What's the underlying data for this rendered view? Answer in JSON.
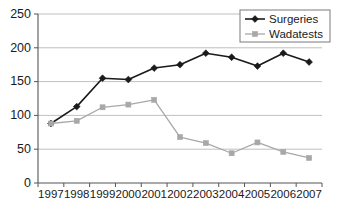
{
  "chart_data": {
    "type": "line",
    "title": "",
    "subtitle": "",
    "xlabel": "",
    "ylabel": "",
    "categories": [
      "1997",
      "1998",
      "1999",
      "2000",
      "2001",
      "2002",
      "2003",
      "2004",
      "2005",
      "2006",
      "2007"
    ],
    "x": [
      1997,
      1998,
      1999,
      2000,
      2001,
      2002,
      2003,
      2004,
      2005,
      2006,
      2007
    ],
    "series": [
      {
        "name": "Surgeries",
        "color": "#1a1a1a",
        "marker": "diamond",
        "values": [
          88,
          113,
          155,
          153,
          170,
          175,
          192,
          186,
          173,
          192,
          179
        ]
      },
      {
        "name": "Wadatests",
        "color": "#a8a8a8",
        "marker": "square",
        "values": [
          88,
          92,
          112,
          116,
          123,
          68,
          59,
          44,
          60,
          46,
          37
        ]
      }
    ],
    "ylim": [
      0,
      250
    ],
    "yticks": [
      0,
      50,
      100,
      150,
      200,
      250
    ],
    "ytick_labels": [
      "0",
      "50",
      "100",
      "150",
      "200",
      "250"
    ],
    "grid": true,
    "grid_axis": "y",
    "legend_position": "top-right",
    "legend_entries": [
      "Surgeries",
      "Wadatests"
    ]
  },
  "colors": {
    "series_surgeries": "#1a1a1a",
    "series_wadatests": "#a8a8a8",
    "gridline": "#b9b9b9",
    "axis": "#555555",
    "background": "#ffffff"
  }
}
